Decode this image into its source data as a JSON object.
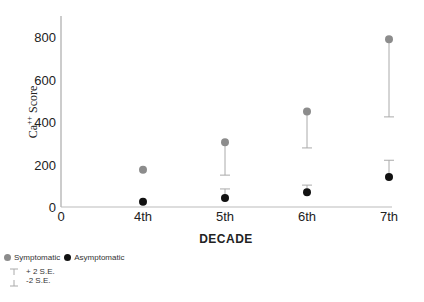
{
  "chart_data": {
    "type": "scatter",
    "title": "",
    "xlabel": "DECADE",
    "ylabel": "Ca++ Score",
    "ylabel_base": "Ca",
    "ylabel_sup": "++",
    "ylabel_rest": " Score",
    "x_origin_label": "0",
    "categories": [
      "4th",
      "5th",
      "6th",
      "7th"
    ],
    "yticks": [
      0,
      200,
      400,
      600,
      800
    ],
    "ylim": [
      0,
      880
    ],
    "grid": false,
    "series": [
      {
        "name": "Symptomatic",
        "color": "#8c8c8c",
        "values": [
          175,
          305,
          450,
          790
        ],
        "error_direction": "minus",
        "error_bar_end": [
          null,
          150,
          278,
          424
        ]
      },
      {
        "name": "Asymptomatic",
        "color": "#111111",
        "values": [
          25,
          42,
          70,
          141
        ],
        "error_direction": "plus",
        "error_bar_end": [
          null,
          85,
          103,
          220
        ]
      }
    ],
    "legend": {
      "placement": "bottom-left",
      "entries": [
        "Symptomatic",
        "Asymptomatic"
      ],
      "error_labels": [
        "+ 2 S.E.",
        "-2 S.E."
      ]
    }
  }
}
